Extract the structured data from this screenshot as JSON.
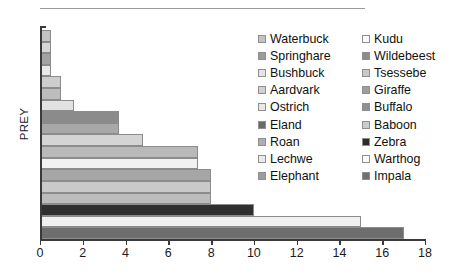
{
  "chart": {
    "type": "bar",
    "orientation": "horizontal",
    "ylabel": "PREY",
    "xlabel": "",
    "title": "",
    "xlim": [
      0,
      18
    ],
    "xticks": [
      "0",
      "2",
      "4",
      "6",
      "8",
      "10",
      "12",
      "14",
      "16",
      "18"
    ],
    "grid": false,
    "legend_position": "right"
  },
  "chart_data": {
    "type": "bar",
    "orientation": "horizontal",
    "title": "",
    "xlabel": "",
    "ylabel": "PREY",
    "xlim": [
      0,
      18
    ],
    "xticks": [
      0,
      2,
      4,
      6,
      8,
      10,
      12,
      14,
      16,
      18
    ],
    "grid": false,
    "legend_position": "right",
    "categories": [
      "Waterbuck",
      "Kudu",
      "Springhare",
      "Wildebeest",
      "Bushbuck",
      "Tsessebe",
      "Aardvark",
      "Giraffe",
      "Ostrich",
      "Buffalo",
      "Eland",
      "Baboon",
      "Roan",
      "Zebra",
      "Lechwe",
      "Warthog",
      "Elephant",
      "Impala"
    ],
    "values": [
      0.5,
      0.5,
      0.5,
      0.5,
      1,
      1,
      1.6,
      3.7,
      3.7,
      4.8,
      7.4,
      7.4,
      8,
      8,
      8,
      10,
      15,
      17
    ],
    "colors": [
      "#c3c3c3",
      "#d7d7d7",
      "#a3a3a3",
      "#e9e9e9",
      "#cdcdcd",
      "#bdbdbd",
      "#e2e2e2",
      "#8b8b8b",
      "#a8a8a8",
      "#d4d4d4",
      "#b9b9b9",
      "#f2f2f2",
      "#a6a6a6",
      "#c9c9c9",
      "#bcbcbc",
      "#2f2f2f",
      "#f0f0f0",
      "#6e6e6e"
    ]
  },
  "legend": {
    "items": [
      {
        "label": "Waterbuck",
        "color": "#c3c3c3"
      },
      {
        "label": "Kudu",
        "color": "#fafafa"
      },
      {
        "label": "Springhare",
        "color": "#9a9a9a"
      },
      {
        "label": "Wildebeest",
        "color": "#8d8d8d"
      },
      {
        "label": "Bushbuck",
        "color": "#e4e4e4"
      },
      {
        "label": "Tsessebe",
        "color": "#c9c9c9"
      },
      {
        "label": "Aardvark",
        "color": "#d2d2d2"
      },
      {
        "label": "Giraffe",
        "color": "#9e9e9e"
      },
      {
        "label": "Ostrich",
        "color": "#e8e8e8"
      },
      {
        "label": "Buffalo",
        "color": "#8f8f8f"
      },
      {
        "label": "Eland",
        "color": "#6a6a6a"
      },
      {
        "label": "Baboon",
        "color": "#cccccc"
      },
      {
        "label": "Roan",
        "color": "#aeaeae"
      },
      {
        "label": "Zebra",
        "color": "#2b2b2b"
      },
      {
        "label": "Lechwe",
        "color": "#ebebeb"
      },
      {
        "label": "Warthog",
        "color": "#fafafa"
      },
      {
        "label": "Elephant",
        "color": "#9c9c9c"
      },
      {
        "label": "Impala",
        "color": "#707070"
      }
    ]
  }
}
